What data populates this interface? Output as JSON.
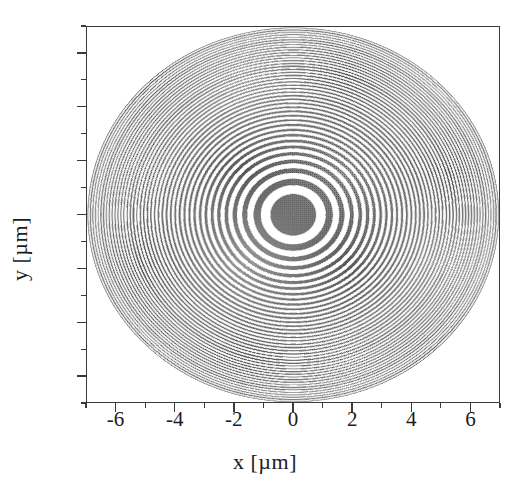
{
  "figure": {
    "kind": "scientific-plot",
    "background_color": "#ffffff",
    "frame_color": "#3a3a3a",
    "pattern_color": "#6e6e6e",
    "pattern_color_light": "#ffffff"
  },
  "axes": {
    "x_title": "x [µm]",
    "y_title": "y [µm]",
    "x_ticklabels": [
      "-6",
      "-4",
      "-2",
      "0",
      "2",
      "4",
      "6"
    ],
    "y_ticklabels": [
      "6",
      "4",
      "2",
      "0",
      "-2",
      "-4",
      "-6"
    ],
    "x_tickvalues": [
      -6,
      -4,
      -2,
      0,
      2,
      4,
      6
    ],
    "y_tickvalues": [
      6,
      4,
      2,
      0,
      -2,
      -4,
      -6
    ],
    "x_minor_tickvalues": [
      -7,
      -5,
      -3,
      -1,
      1,
      3,
      5,
      7
    ],
    "y_minor_tickvalues": [
      -7,
      -5,
      -3,
      -1,
      1,
      3,
      5,
      7
    ],
    "x_range": [
      -7,
      7
    ],
    "y_range": [
      -7,
      7
    ],
    "tick_direction": "out",
    "grid": false
  },
  "chart_data": {
    "type": "heatmap",
    "title": "",
    "subtitle": "",
    "xlabel": "x [µm]",
    "ylabel": "y [µm]",
    "xlim": [
      -7,
      7
    ],
    "ylim": [
      -7,
      7
    ],
    "legend": "none",
    "grid": false,
    "pattern": "fresnel-zone-plate",
    "center": [
      0,
      0
    ],
    "innermost_disk_radius_um": 0.78,
    "outer_radius_um": 7.0,
    "number_of_dark_zones": 15,
    "zone_boundary_radii_um": [
      0.78,
      1.1,
      1.35,
      1.56,
      1.74,
      1.91,
      2.06,
      2.21,
      2.34,
      2.47,
      2.59,
      2.7,
      2.81,
      2.92,
      3.02,
      3.12,
      3.21,
      3.31,
      3.4,
      3.49,
      3.57,
      3.66,
      3.74,
      3.82,
      3.9,
      3.98,
      4.05,
      4.13,
      4.2,
      4.27,
      4.34,
      4.41,
      4.48,
      4.55,
      4.61,
      4.68,
      4.74,
      4.81,
      4.87,
      4.93,
      4.99,
      5.05,
      5.11,
      5.17,
      5.23,
      5.29,
      5.34,
      5.4,
      5.46,
      5.51,
      5.57,
      5.62,
      5.67,
      5.73,
      5.78,
      5.83,
      5.88,
      5.93,
      5.98,
      6.03,
      6.08,
      6.13,
      6.18,
      6.23,
      6.28,
      6.33,
      6.37,
      6.42,
      6.47,
      6.51,
      6.56,
      6.61,
      6.65,
      6.7,
      6.74,
      6.79,
      6.83,
      6.87,
      6.92,
      6.96,
      7.0
    ],
    "dark_zone_indices": [
      0,
      2,
      4,
      6,
      8,
      10,
      12,
      14,
      16,
      18,
      20,
      22,
      24,
      26,
      28
    ],
    "colors": {
      "opaque": "#6e6e6e",
      "transparent": "#ffffff"
    }
  }
}
